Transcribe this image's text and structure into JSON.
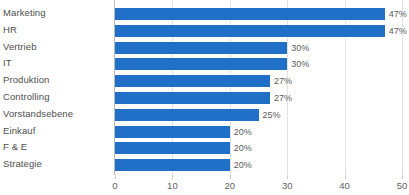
{
  "chart_data": {
    "type": "bar",
    "orientation": "horizontal",
    "title": "",
    "xlabel": "",
    "ylabel": "",
    "xlim": [
      0,
      50
    ],
    "xticks": [
      0,
      10,
      20,
      30,
      40,
      50
    ],
    "grid": true,
    "legend": false,
    "bar_color": "#2070c8",
    "label_color": "#4e4e4e",
    "value_label_color": "#5b5b5b",
    "gridline_color": "#e3e3e3",
    "categories": [
      "Marketing",
      "HR",
      "Vertrieb",
      "IT",
      "Produktion",
      "Controlling",
      "Vorstandsebene",
      "Einkauf",
      "F & E",
      "Strategie"
    ],
    "values": [
      47,
      47,
      30,
      30,
      27,
      27,
      25,
      20,
      20,
      20
    ],
    "value_labels": [
      "47%",
      "47%",
      "30%",
      "30%",
      "27%",
      "27%",
      "25%",
      "20%",
      "20%",
      "20%"
    ],
    "tick_labels": [
      "0",
      "10",
      "20",
      "30",
      "40",
      "50"
    ]
  }
}
